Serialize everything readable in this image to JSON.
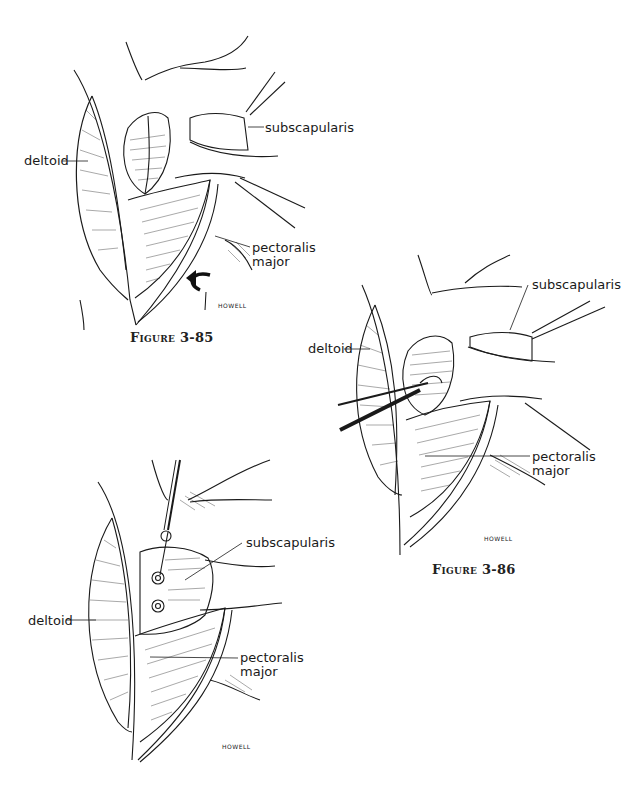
{
  "figures": [
    {
      "id": "fig-3-85",
      "caption": "Figure 3-85",
      "labels": {
        "subscapularis": "subscapularis",
        "deltoid": "deltoid",
        "pectoralis": "pectoralis",
        "major": "major"
      },
      "signature": "HOWELL",
      "icons": [
        "rotation-arrow-icon"
      ]
    },
    {
      "id": "fig-3-86",
      "caption": "Figure 3-86",
      "labels": {
        "subscapularis": "subscapularis",
        "deltoid": "deltoid",
        "pectoralis": "pectoralis",
        "major": "major"
      },
      "signature": "HOWELL"
    },
    {
      "id": "fig-3-87",
      "caption": "",
      "labels": {
        "subscapularis": "subscapularis",
        "deltoid": "deltoid",
        "pectoralis": "pectoralis",
        "major": "major"
      },
      "signature": "HOWELL"
    }
  ]
}
